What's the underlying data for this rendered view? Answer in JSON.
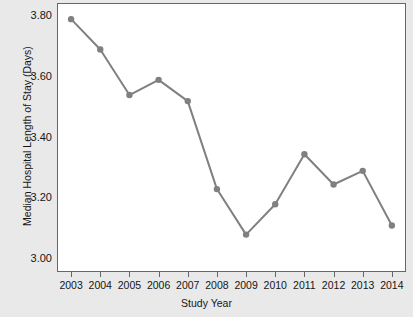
{
  "chart_data": {
    "type": "line",
    "title": "",
    "subtitle": "",
    "xlabel": "Study Year",
    "ylabel": "Median Hospital Length of Stay (Days)",
    "categories": [
      "2003",
      "2004",
      "2005",
      "2006",
      "2007",
      "2008",
      "2009",
      "2010",
      "2011",
      "2012",
      "2013",
      "2014"
    ],
    "x": [
      2003,
      2004,
      2005,
      2006,
      2007,
      2008,
      2009,
      2010,
      2011,
      2012,
      2013,
      2014
    ],
    "values": [
      3.79,
      3.69,
      3.54,
      3.59,
      3.52,
      3.23,
      3.08,
      3.18,
      3.345,
      3.245,
      3.29,
      3.11
    ],
    "series": [
      {
        "name": "Median Hospital Length of Stay",
        "values": [
          3.79,
          3.69,
          3.54,
          3.59,
          3.52,
          3.23,
          3.08,
          3.18,
          3.345,
          3.245,
          3.29,
          3.11
        ]
      }
    ],
    "ylim": [
      2.96,
      3.84
    ],
    "xlim": [
      2002.55,
      2014.45
    ],
    "yticks": [
      3.0,
      3.2,
      3.4,
      3.6,
      3.8
    ],
    "ytick_labels": [
      "3.00",
      "3.20",
      "3.40",
      "3.60",
      "3.80"
    ],
    "xticks": [
      2003,
      2004,
      2005,
      2006,
      2007,
      2008,
      2009,
      2010,
      2011,
      2012,
      2013,
      2014
    ],
    "xtick_labels": [
      "2003",
      "2004",
      "2005",
      "2006",
      "2007",
      "2008",
      "2009",
      "2010",
      "2011",
      "2012",
      "2013",
      "2014"
    ],
    "grid": false,
    "legend": null,
    "legend_position": "none",
    "annotations": [],
    "colors": {
      "line": "#808080",
      "marker": "#808080",
      "plot_background": "#ffffff",
      "figure_background": "#e9e9e9",
      "axis": "#666666",
      "text": "#161616"
    },
    "style": {
      "line_width": 2.0,
      "marker": "circle",
      "marker_size": 3.2
    }
  }
}
